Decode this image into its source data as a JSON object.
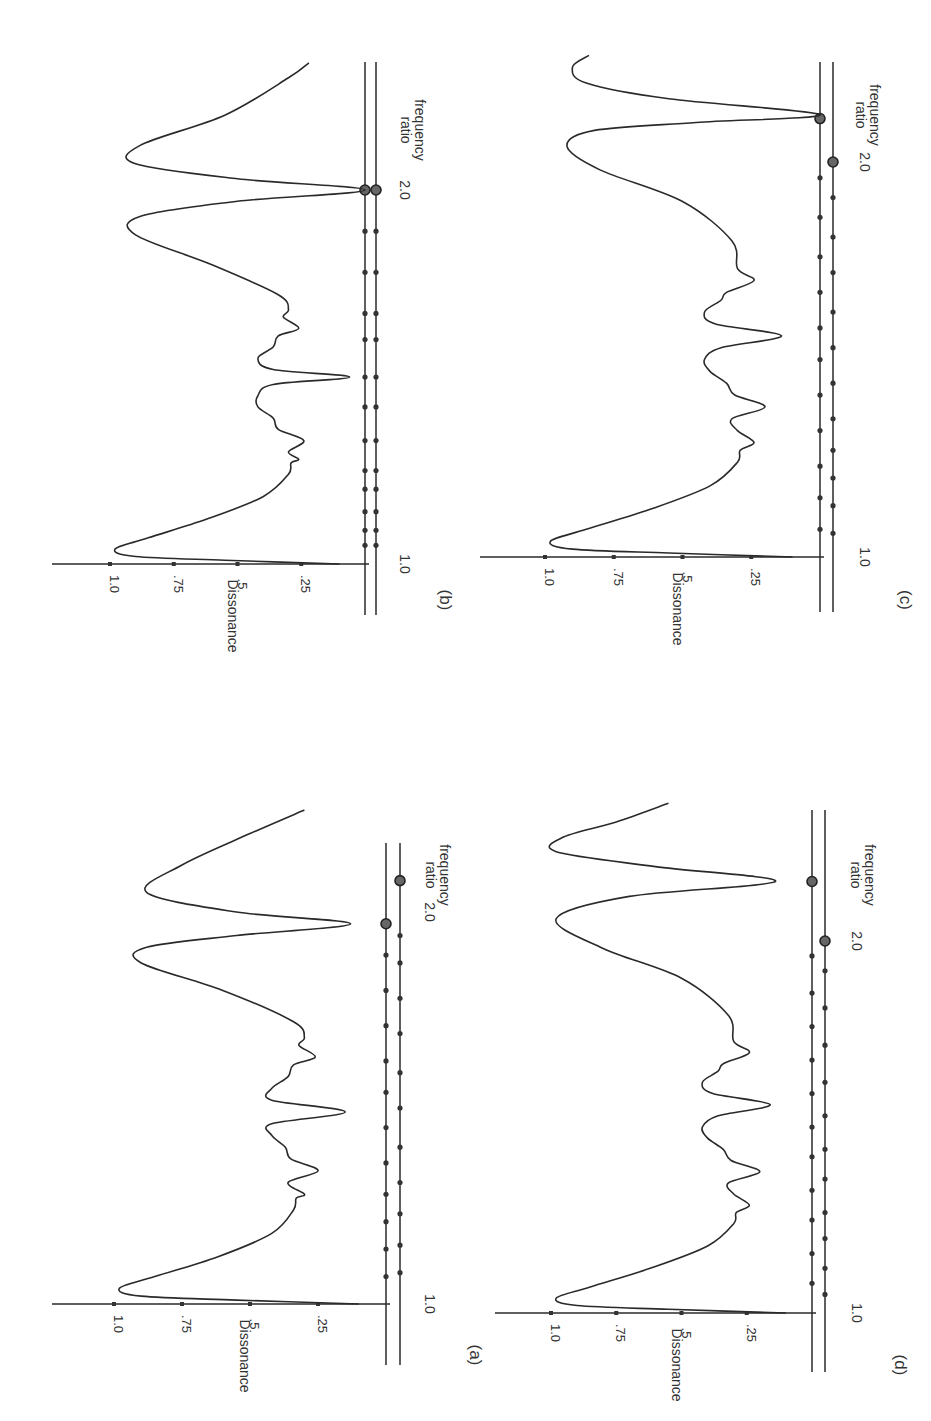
{
  "figure": {
    "rotation": "panels rotated 90deg clockwise",
    "ink_color": "#2a2a2a",
    "background": "#ffffff"
  },
  "chart_data": [
    {
      "id": "b",
      "panel_label": "(b)",
      "type": "line",
      "xlabel": "frequency ratio",
      "ylabel": "Dissonance",
      "x_ticks": [
        "1.0",
        "2.0"
      ],
      "y_ticks": [
        "1.0",
        ".75",
        ".5",
        ".25"
      ],
      "xlim": [
        1.0,
        2.35
      ],
      "ylim": [
        0,
        1.15
      ],
      "series": [
        {
          "name": "dissonance curve",
          "x": [
            1.0,
            1.01,
            1.02,
            1.04,
            1.07,
            1.12,
            1.18,
            1.24,
            1.27,
            1.28,
            1.3,
            1.33,
            1.36,
            1.39,
            1.42,
            1.45,
            1.48,
            1.5,
            1.52,
            1.55,
            1.58,
            1.61,
            1.63,
            1.66,
            1.68,
            1.72,
            1.8,
            1.88,
            1.93,
            1.97,
            2.0,
            2.03,
            2.07,
            2.12,
            2.2,
            2.3,
            2.34
          ],
          "y": [
            0.1,
            0.55,
            0.9,
            0.98,
            0.85,
            0.62,
            0.4,
            0.3,
            0.29,
            0.26,
            0.3,
            0.24,
            0.34,
            0.36,
            0.42,
            0.42,
            0.36,
            0.06,
            0.36,
            0.42,
            0.36,
            0.34,
            0.26,
            0.32,
            0.3,
            0.34,
            0.6,
            0.9,
            0.88,
            0.5,
            0.0,
            0.5,
            0.9,
            0.88,
            0.55,
            0.3,
            0.22
          ]
        }
      ],
      "markers_inner": [
        1.05,
        1.09,
        1.14,
        1.2,
        1.25,
        1.33,
        1.42,
        1.5,
        1.6,
        1.67,
        1.78,
        1.89
      ],
      "markers_outer": [
        1.05,
        1.09,
        1.14,
        1.2,
        1.25,
        1.33,
        1.42,
        1.5,
        1.6,
        1.67,
        1.78,
        1.89
      ],
      "rings_inner": [
        2.0
      ],
      "rings_outer": [
        2.0
      ]
    },
    {
      "id": "c",
      "panel_label": "(c)",
      "type": "line",
      "xlabel": "frequency ratio",
      "ylabel": "Dissonance",
      "x_ticks": [
        "1.0",
        "2.0"
      ],
      "y_ticks": [
        "1.0",
        ".75",
        ".5",
        ".25"
      ],
      "xlim": [
        1.0,
        2.35
      ],
      "ylim": [
        0,
        1.15
      ],
      "series": [
        {
          "name": "dissonance curve",
          "x": [
            1.0,
            1.01,
            1.02,
            1.04,
            1.07,
            1.12,
            1.18,
            1.24,
            1.27,
            1.29,
            1.32,
            1.35,
            1.38,
            1.41,
            1.44,
            1.47,
            1.5,
            1.53,
            1.56,
            1.59,
            1.62,
            1.65,
            1.67,
            1.7,
            1.73,
            1.8,
            1.9,
            1.98,
            2.04,
            2.08,
            2.1,
            2.12,
            2.16,
            2.2,
            2.24,
            2.27
          ],
          "y": [
            0.1,
            0.55,
            0.9,
            0.98,
            0.85,
            0.62,
            0.4,
            0.3,
            0.29,
            0.24,
            0.3,
            0.32,
            0.2,
            0.31,
            0.34,
            0.4,
            0.42,
            0.36,
            0.14,
            0.38,
            0.42,
            0.36,
            0.34,
            0.24,
            0.3,
            0.32,
            0.5,
            0.8,
            0.92,
            0.82,
            0.45,
            0.0,
            0.55,
            0.85,
            0.9,
            0.84
          ]
        }
      ],
      "markers_inner": [
        1.07,
        1.15,
        1.23,
        1.32,
        1.41,
        1.5,
        1.58,
        1.67,
        1.76,
        1.86,
        1.96
      ],
      "markers_outer": [
        1.06,
        1.13,
        1.2,
        1.27,
        1.35,
        1.44,
        1.53,
        1.62,
        1.72,
        1.81,
        1.91
      ],
      "rings_inner": [
        2.11
      ],
      "rings_outer": [
        2.0
      ]
    },
    {
      "id": "a",
      "panel_label": "(a)",
      "type": "line",
      "xlabel": "frequency ratio",
      "ylabel": "Dissonance",
      "x_ticks": [
        "1.0",
        "2.0"
      ],
      "y_ticks": [
        "1.0",
        ".75",
        ".5",
        ".25"
      ],
      "xlim": [
        1.0,
        2.35
      ],
      "ylim": [
        0,
        1.15
      ],
      "series": [
        {
          "name": "dissonance curve",
          "x": [
            1.0,
            1.01,
            1.02,
            1.04,
            1.07,
            1.12,
            1.18,
            1.24,
            1.27,
            1.28,
            1.31,
            1.34,
            1.37,
            1.4,
            1.43,
            1.46,
            1.49,
            1.52,
            1.55,
            1.58,
            1.61,
            1.63,
            1.66,
            1.68,
            1.72,
            1.8,
            1.87,
            1.91,
            1.94,
            1.97,
            2.0,
            2.05,
            2.12,
            2.2,
            2.26
          ],
          "y": [
            0.1,
            0.55,
            0.9,
            0.98,
            0.85,
            0.62,
            0.42,
            0.34,
            0.33,
            0.3,
            0.36,
            0.25,
            0.35,
            0.37,
            0.42,
            0.42,
            0.15,
            0.42,
            0.42,
            0.36,
            0.34,
            0.26,
            0.32,
            0.3,
            0.34,
            0.6,
            0.9,
            0.88,
            0.55,
            0.13,
            0.55,
            0.88,
            0.75,
            0.5,
            0.3
          ]
        }
      ],
      "markers_inner": [
        1.07,
        1.14,
        1.21,
        1.28,
        1.36,
        1.45,
        1.54,
        1.62,
        1.71,
        1.8,
        1.89
      ],
      "markers_outer": [
        1.08,
        1.15,
        1.23,
        1.31,
        1.4,
        1.5,
        1.59,
        1.69,
        1.78,
        1.87,
        1.94
      ],
      "rings_inner": [
        1.97
      ],
      "rings_outer": [
        2.08
      ]
    },
    {
      "id": "d",
      "panel_label": "(d)",
      "type": "line",
      "xlabel": "frequency ratio",
      "ylabel": "Dissonance",
      "x_ticks": [
        "1.0",
        "2.0"
      ],
      "y_ticks": [
        "1.0",
        ".75",
        ".5",
        ".25"
      ],
      "xlim": [
        1.0,
        2.35
      ],
      "ylim": [
        0,
        1.15
      ],
      "series": [
        {
          "name": "dissonance curve",
          "x": [
            1.0,
            1.01,
            1.02,
            1.04,
            1.07,
            1.12,
            1.18,
            1.24,
            1.27,
            1.29,
            1.32,
            1.35,
            1.38,
            1.41,
            1.44,
            1.47,
            1.5,
            1.53,
            1.56,
            1.59,
            1.62,
            1.65,
            1.67,
            1.7,
            1.73,
            1.8,
            1.9,
            1.98,
            2.06,
            2.12,
            2.16,
            2.2,
            2.24,
            2.28,
            2.32,
            2.37
          ],
          "y": [
            0.1,
            0.55,
            0.9,
            0.98,
            0.85,
            0.62,
            0.4,
            0.3,
            0.29,
            0.24,
            0.3,
            0.32,
            0.2,
            0.31,
            0.34,
            0.4,
            0.42,
            0.36,
            0.16,
            0.38,
            0.42,
            0.36,
            0.34,
            0.24,
            0.3,
            0.32,
            0.5,
            0.8,
            0.98,
            0.7,
            0.14,
            0.6,
            0.98,
            0.95,
            0.75,
            0.55
          ]
        }
      ],
      "markers_inner": [
        1.08,
        1.16,
        1.25,
        1.33,
        1.42,
        1.5,
        1.59,
        1.68,
        1.77,
        1.86,
        1.96
      ],
      "markers_outer": [
        1.05,
        1.12,
        1.2,
        1.27,
        1.36,
        1.44,
        1.53,
        1.62,
        1.72,
        1.82,
        1.92
      ],
      "rings_inner": [
        2.16
      ],
      "rings_outer": [
        2.0
      ]
    }
  ],
  "labels": {
    "ylabel": "Dissonance",
    "xlabel_line1": "frequency",
    "xlabel_line2": "ratio",
    "tick_1": "1.0",
    "tick_075": ".75",
    "tick_05": ".5",
    "tick_025": ".25",
    "freq_1": "1.0",
    "freq_2": "2.0",
    "panel_b": "(b)",
    "panel_c": "(c)",
    "panel_a": "(a)",
    "panel_d": "(d)"
  }
}
